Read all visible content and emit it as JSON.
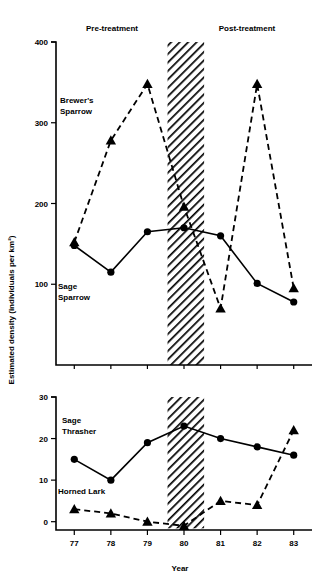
{
  "figure": {
    "period_labels": {
      "pre": "Pre-treatment",
      "post": "Post-treatment"
    },
    "y_axis_title": "Estimated density (individuals per km²)",
    "x_axis_title": "Year"
  },
  "chart_data": [
    {
      "type": "line",
      "panel": "top",
      "title": "",
      "xlabel": "",
      "ylabel": "Estimated density (individuals per km²)",
      "x": [
        77,
        78,
        79,
        80,
        81,
        82,
        83
      ],
      "categories": [
        "77",
        "78",
        "79",
        "80",
        "81",
        "82",
        "83"
      ],
      "xlim": [
        76.5,
        83.5
      ],
      "ylim": [
        0,
        400
      ],
      "yticks": [
        100,
        200,
        300,
        400
      ],
      "xticks": [
        "77",
        "78",
        "79",
        "80",
        "81",
        "82",
        "83"
      ],
      "grid": false,
      "legend_position": "inline-annotation",
      "shaded_band": {
        "x_start": 79.55,
        "x_end": 80.55,
        "style": "diagonal-hatch"
      },
      "series": [
        {
          "name": "Brewer's Sparrow",
          "label_lines": [
            "Brewer's",
            "Sparrow"
          ],
          "linestyle": "dashed",
          "marker": "triangle",
          "values": [
            152,
            278,
            348,
            196,
            70,
            348,
            95
          ]
        },
        {
          "name": "Sage Sparrow",
          "label_lines": [
            "Sage",
            "Sparrow"
          ],
          "linestyle": "solid",
          "marker": "circle",
          "values": [
            148,
            115,
            165,
            170,
            160,
            101,
            78
          ]
        }
      ]
    },
    {
      "type": "line",
      "panel": "bottom",
      "title": "",
      "xlabel": "Year",
      "ylabel": "",
      "x": [
        77,
        78,
        79,
        80,
        81,
        82,
        83
      ],
      "categories": [
        "77",
        "78",
        "79",
        "80",
        "81",
        "82",
        "83"
      ],
      "xlim": [
        76.5,
        83.5
      ],
      "ylim": [
        -2,
        30
      ],
      "yticks": [
        0,
        10,
        20,
        30
      ],
      "xticks": [
        "77",
        "78",
        "79",
        "80",
        "81",
        "82",
        "83"
      ],
      "grid": false,
      "legend_position": "inline-annotation",
      "shaded_band": {
        "x_start": 79.55,
        "x_end": 80.55,
        "style": "diagonal-hatch"
      },
      "series": [
        {
          "name": "Sage Thrasher",
          "label_lines": [
            "Sage",
            "Thrasher"
          ],
          "linestyle": "solid",
          "marker": "circle",
          "values": [
            15,
            10,
            19,
            23,
            20,
            18,
            16
          ]
        },
        {
          "name": "Horned Lark",
          "label_lines": [
            "Horned Lark"
          ],
          "linestyle": "dashed",
          "marker": "triangle",
          "values": [
            3,
            2,
            0,
            -1,
            5,
            4,
            22
          ]
        }
      ]
    }
  ]
}
